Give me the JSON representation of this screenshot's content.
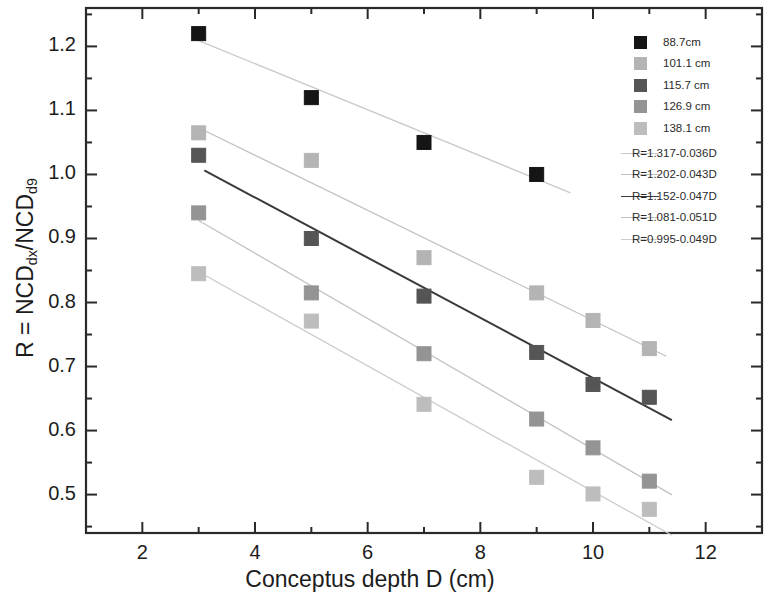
{
  "chart_data": {
    "type": "scatter",
    "title": "",
    "xlabel": "Conceptus depth D (cm)",
    "ylabel": "R = NCD_dx/NCD_d9",
    "ylabel_parts": {
      "prefix": "R = NCD",
      "sub1": "dx",
      "mid": "/NCD",
      "sub2": "d9"
    },
    "xlim": [
      1,
      13
    ],
    "ylim": [
      0.44,
      1.26
    ],
    "xticks": [
      2,
      4,
      6,
      8,
      10,
      12
    ],
    "xticklabels": [
      "2",
      "4",
      "6",
      "8",
      "10",
      "12"
    ],
    "yticks": [
      0.5,
      0.6,
      0.7,
      0.8,
      0.9,
      1.0,
      1.1,
      1.2
    ],
    "yticklabels": [
      "0.5",
      "0.6",
      "0.7",
      "0.8",
      "0.9",
      "1.0",
      "1.1",
      "1.2"
    ],
    "yminorticks": [
      0.45,
      0.55,
      0.65,
      0.75,
      0.85,
      0.95,
      1.05,
      1.15,
      1.25
    ],
    "xminorticks": [
      1,
      3,
      5,
      7,
      9,
      11,
      13
    ],
    "grid": false,
    "legend_position": "top-right",
    "series": [
      {
        "name": "88.7cm",
        "color": "#151515",
        "marker": "square",
        "x": [
          3,
          5,
          7,
          9
        ],
        "y": [
          1.22,
          1.12,
          1.05,
          1.0
        ]
      },
      {
        "name": "101.1 cm",
        "color": "#b4b4b4",
        "marker": "square",
        "x": [
          3,
          5,
          7,
          9,
          10,
          11
        ],
        "y": [
          1.065,
          1.022,
          0.87,
          0.815,
          0.772,
          0.728
        ]
      },
      {
        "name": "115.7 cm",
        "color": "#555555",
        "marker": "square",
        "x": [
          3,
          5,
          7,
          9,
          10,
          11
        ],
        "y": [
          1.03,
          0.9,
          0.81,
          0.722,
          0.672,
          0.652
        ]
      },
      {
        "name": "126.9 cm",
        "color": "#949494",
        "marker": "square",
        "x": [
          3,
          5,
          7,
          9,
          10,
          11
        ],
        "y": [
          0.94,
          0.815,
          0.72,
          0.618,
          0.573,
          0.521
        ]
      },
      {
        "name": "138.1 cm",
        "color": "#bdbdbd",
        "marker": "square",
        "x": [
          3,
          5,
          7,
          9,
          10,
          11
        ],
        "y": [
          0.845,
          0.771,
          0.641,
          0.527,
          0.501,
          0.477
        ]
      }
    ],
    "fits": [
      {
        "label": "R=1.317-0.036D",
        "intercept": 1.317,
        "slope": -0.036,
        "color": "#c9c9c9",
        "xrange": [
          3,
          9.6
        ]
      },
      {
        "label": "R=1.202-0.043D",
        "intercept": 1.202,
        "slope": -0.043,
        "color": "#c2c2c2",
        "xrange": [
          3,
          11.3
        ]
      },
      {
        "label": "R=1.152-0.047D",
        "intercept": 1.152,
        "slope": -0.047,
        "color": "#3a3a3a",
        "xrange": [
          3.1,
          11.4
        ]
      },
      {
        "label": "R=1.081-0.051D",
        "intercept": 1.081,
        "slope": -0.051,
        "color": "#c2c2c2",
        "xrange": [
          3,
          11.4
        ]
      },
      {
        "label": "R=0.995-0.049D",
        "intercept": 0.995,
        "slope": -0.049,
        "color": "#cccccc",
        "xrange": [
          3,
          11.4
        ]
      }
    ]
  },
  "legend": {
    "marker_entries": [
      "88.7cm",
      "101.1 cm",
      "115.7 cm",
      "126.9 cm",
      "138.1 cm"
    ],
    "line_entries": [
      "R=1.317-0.036D",
      "R=1.202-0.043D",
      "R=1.152-0.047D",
      "R=1.081-0.051D",
      "R=0.995-0.049D"
    ]
  },
  "axes": {
    "x_title": "Conceptus depth D (cm)",
    "y_title_prefix": "R = NCD",
    "y_title_sub1": "dx",
    "y_title_mid": "/NCD",
    "y_title_sub2": "d9"
  }
}
